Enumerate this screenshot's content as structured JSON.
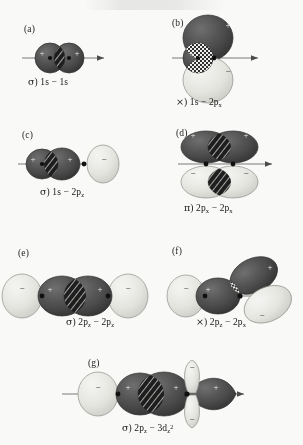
{
  "figure": {
    "title": "",
    "background": "#fdfdfb",
    "colors": {
      "positive_lobe": "#4a4a4a",
      "negative_lobe": "#e8e8e4",
      "overlap_bonding": "#1a1a1a",
      "axis": "#6f6f6f",
      "nucleus": "#0d0d0d",
      "text": "#141414"
    },
    "legend_note": {
      "sigma_symbol": "σ",
      "pi_symbol": "π",
      "nonbonding_symbol": "×"
    }
  },
  "panels": [
    {
      "id": "a",
      "tag": "(a)",
      "type": "sigma",
      "symbol": "σ",
      "orbital_left": "1s",
      "orbital_right": "1s",
      "caption_plain": "σ) 1s − 1s",
      "signs_left": "+",
      "signs_right": "+",
      "overlap": "constructive",
      "hatch": "diagonal"
    },
    {
      "id": "b",
      "tag": "(b)",
      "type": "nonbonding",
      "symbol": "×",
      "orbital_left": "1s",
      "orbital_right": "2p",
      "orbital_right_sub": "x",
      "caption_plain": "×) 1s − 2px",
      "signs_left": "+",
      "signs_right_top": "+",
      "signs_right_bottom": "−",
      "overlap": "cancelling",
      "hatch": "checker"
    },
    {
      "id": "c",
      "tag": "(c)",
      "type": "sigma",
      "symbol": "σ",
      "orbital_left": "1s",
      "orbital_right": "2p",
      "orbital_right_sub": "z",
      "caption_plain": "σ) 1s − 2pz",
      "signs_left": "+",
      "signs_right_near": "+",
      "signs_right_far": "−",
      "overlap": "constructive",
      "hatch": "diagonal"
    },
    {
      "id": "d",
      "tag": "(d)",
      "type": "pi",
      "symbol": "π",
      "orbital_left": "2p",
      "orbital_left_sub": "x",
      "orbital_right": "2p",
      "orbital_right_sub": "x",
      "caption_plain": "π) 2px − 2px",
      "signs_top": "+",
      "signs_bottom": "−",
      "overlap": "constructive",
      "hatch": "diagonal"
    },
    {
      "id": "e",
      "tag": "(e)",
      "type": "sigma",
      "symbol": "σ",
      "orbital_left": "2p",
      "orbital_left_sub": "z",
      "orbital_right": "2p",
      "orbital_right_sub": "z",
      "caption_plain": "σ) 2pz − 2pz",
      "signs_outer": "−",
      "signs_inner": "+",
      "overlap": "constructive",
      "hatch": "diagonal"
    },
    {
      "id": "f",
      "tag": "(f)",
      "type": "nonbonding",
      "symbol": "×",
      "orbital_left": "2p",
      "orbital_left_sub": "z",
      "orbital_right": "2p",
      "orbital_right_sub": "x",
      "caption_plain": "×) 2pz − 2px",
      "signs_left_outer": "−",
      "signs_left_inner": "+",
      "signs_right_top": "+",
      "signs_right_bottom": "−",
      "overlap": "cancelling",
      "hatch": "checker"
    },
    {
      "id": "g",
      "tag": "(g)",
      "type": "sigma",
      "symbol": "σ",
      "orbital_left": "2p",
      "orbital_left_sub": "z",
      "orbital_right": "3d",
      "orbital_right_sub": "z",
      "orbital_right_sup": "2",
      "caption_plain": "σ) 2pz − 3dz2",
      "signs_left_outer": "−",
      "signs_left_inner": "+",
      "signs_right_lobe": "+",
      "signs_torus": "−",
      "overlap": "constructive",
      "hatch": "diagonal"
    }
  ]
}
